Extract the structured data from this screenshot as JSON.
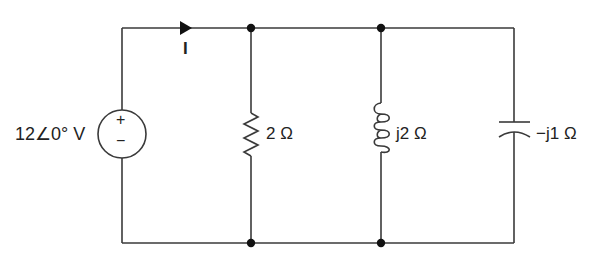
{
  "diagram": {
    "type": "circuit",
    "source": {
      "label": "12∠0° V",
      "plus_sign": "+",
      "minus_sign": "−"
    },
    "current": {
      "label": "I",
      "direction": "right"
    },
    "components": [
      {
        "kind": "resistor",
        "label": "2 Ω"
      },
      {
        "kind": "inductor",
        "label": "j2 Ω"
      },
      {
        "kind": "capacitor",
        "label": "−j1 Ω"
      }
    ],
    "colors": {
      "wire": "#3a3a3a",
      "node": "#111111",
      "text": "#222222"
    }
  }
}
